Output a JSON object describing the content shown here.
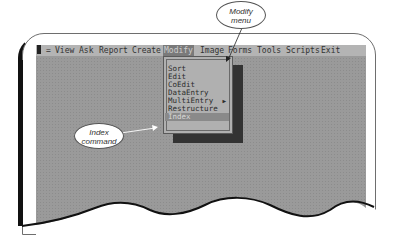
{
  "menubar": {
    "items": [
      {
        "label": "View"
      },
      {
        "label": "Ask"
      },
      {
        "label": "Report"
      },
      {
        "label": "Create"
      },
      {
        "label": "Modify",
        "active": true
      },
      {
        "label": "Image"
      },
      {
        "label": "Forms"
      },
      {
        "label": "Tools"
      },
      {
        "label": "Scripts"
      },
      {
        "label": "Exit"
      }
    ],
    "leading_char": "="
  },
  "modify_menu": {
    "items": [
      {
        "label": "Sort"
      },
      {
        "label": "Edit"
      },
      {
        "label": "CoEdit"
      },
      {
        "label": "DataEntry"
      },
      {
        "label": "MultiEntry",
        "submenu_arrow": "▶"
      },
      {
        "label": "Restructure"
      },
      {
        "label": "Index",
        "selected": true
      }
    ]
  },
  "callouts": {
    "modify_menu": {
      "line1": "Modify",
      "line2": "menu"
    },
    "index_command": {
      "line1": "Index",
      "line2": "command"
    }
  },
  "colors": {
    "screen_bg": "#9a9a9a",
    "menubar_bg": "#b4b4b4",
    "menu_bg": "#b0b0b0",
    "highlight": "#8a8a8a",
    "shadow": "#333333"
  }
}
